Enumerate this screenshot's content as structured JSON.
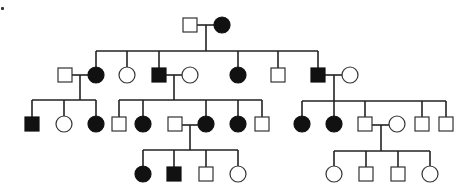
{
  "diagram": {
    "type": "pedigree",
    "corner_mark": ".",
    "colors": {
      "affected": "#111111",
      "unaffected": "#ffffff",
      "line": "#222222"
    },
    "legend": {
      "square": "male",
      "circle": "female",
      "filled": "affected",
      "open": "unaffected"
    },
    "generations": [
      {
        "label": "I",
        "y": 25,
        "individuals": [
          {
            "id": "I-1",
            "sex": "male",
            "affected": false,
            "x": 190
          },
          {
            "id": "I-2",
            "sex": "female",
            "affected": true,
            "x": 222
          }
        ]
      },
      {
        "label": "II",
        "y": 75,
        "individuals": [
          {
            "id": "II-spouse-1",
            "sex": "male",
            "affected": false,
            "x": 65,
            "married_in": true
          },
          {
            "id": "II-1",
            "sex": "female",
            "affected": true,
            "x": 96
          },
          {
            "id": "II-2",
            "sex": "female",
            "affected": false,
            "x": 127
          },
          {
            "id": "II-3",
            "sex": "male",
            "affected": true,
            "x": 159
          },
          {
            "id": "II-spouse-2",
            "sex": "female",
            "affected": false,
            "x": 190,
            "married_in": true
          },
          {
            "id": "II-4",
            "sex": "female",
            "affected": true,
            "x": 238
          },
          {
            "id": "II-5",
            "sex": "male",
            "affected": false,
            "x": 278
          },
          {
            "id": "II-6",
            "sex": "male",
            "affected": true,
            "x": 318
          },
          {
            "id": "II-spouse-3",
            "sex": "female",
            "affected": false,
            "x": 350,
            "married_in": true
          }
        ]
      },
      {
        "label": "III",
        "y": 124,
        "individuals": [
          {
            "id": "III-1",
            "sex": "male",
            "affected": true,
            "x": 32
          },
          {
            "id": "III-2",
            "sex": "female",
            "affected": false,
            "x": 64
          },
          {
            "id": "III-3",
            "sex": "female",
            "affected": true,
            "x": 96
          },
          {
            "id": "III-4",
            "sex": "male",
            "affected": false,
            "x": 119
          },
          {
            "id": "III-5",
            "sex": "female",
            "affected": true,
            "x": 143
          },
          {
            "id": "III-spouse-1",
            "sex": "male",
            "affected": false,
            "x": 175,
            "married_in": true
          },
          {
            "id": "III-6",
            "sex": "female",
            "affected": true,
            "x": 206
          },
          {
            "id": "III-7",
            "sex": "female",
            "affected": true,
            "x": 238
          },
          {
            "id": "III-8",
            "sex": "male",
            "affected": false,
            "x": 262
          },
          {
            "id": "III-9",
            "sex": "female",
            "affected": true,
            "x": 302
          },
          {
            "id": "III-10",
            "sex": "female",
            "affected": true,
            "x": 334
          },
          {
            "id": "III-11",
            "sex": "male",
            "affected": false,
            "x": 365
          },
          {
            "id": "III-spouse-2",
            "sex": "female",
            "affected": false,
            "x": 397,
            "married_in": true
          },
          {
            "id": "III-12",
            "sex": "male",
            "affected": false,
            "x": 422
          },
          {
            "id": "III-13",
            "sex": "male",
            "affected": false,
            "x": 446
          }
        ]
      },
      {
        "label": "IV",
        "y": 174,
        "individuals": [
          {
            "id": "IV-1",
            "sex": "female",
            "affected": true,
            "x": 143
          },
          {
            "id": "IV-2",
            "sex": "male",
            "affected": true,
            "x": 174
          },
          {
            "id": "IV-3",
            "sex": "male",
            "affected": false,
            "x": 206
          },
          {
            "id": "IV-4",
            "sex": "female",
            "affected": false,
            "x": 238
          },
          {
            "id": "IV-5",
            "sex": "female",
            "affected": false,
            "x": 334
          },
          {
            "id": "IV-6",
            "sex": "male",
            "affected": false,
            "x": 366
          },
          {
            "id": "IV-7",
            "sex": "male",
            "affected": false,
            "x": 398
          },
          {
            "id": "IV-8",
            "sex": "female",
            "affected": false,
            "x": 430
          }
        ]
      }
    ],
    "lines": [
      [
        197,
        25,
        214,
        25
      ],
      [
        206,
        25,
        206,
        51
      ],
      [
        96,
        51,
        318,
        51
      ],
      [
        96,
        51,
        96,
        67
      ],
      [
        127,
        51,
        127,
        67
      ],
      [
        159,
        51,
        159,
        68
      ],
      [
        238,
        51,
        238,
        67
      ],
      [
        278,
        51,
        278,
        68
      ],
      [
        318,
        51,
        318,
        68
      ],
      [
        72,
        75,
        88,
        75
      ],
      [
        80,
        75,
        80,
        100
      ],
      [
        32,
        100,
        96,
        100
      ],
      [
        32,
        100,
        32,
        117
      ],
      [
        64,
        100,
        64,
        116
      ],
      [
        96,
        100,
        96,
        116
      ],
      [
        166,
        75,
        182,
        75
      ],
      [
        174,
        75,
        174,
        100
      ],
      [
        119,
        100,
        262,
        100
      ],
      [
        119,
        100,
        119,
        117
      ],
      [
        143,
        100,
        143,
        116
      ],
      [
        206,
        100,
        206,
        116
      ],
      [
        238,
        100,
        238,
        116
      ],
      [
        262,
        100,
        262,
        117
      ],
      [
        325,
        75,
        342,
        75
      ],
      [
        334,
        75,
        334,
        101
      ],
      [
        302,
        101,
        446,
        101
      ],
      [
        302,
        101,
        302,
        116
      ],
      [
        334,
        101,
        334,
        116
      ],
      [
        365,
        101,
        365,
        117
      ],
      [
        422,
        101,
        422,
        117
      ],
      [
        446,
        101,
        446,
        117
      ],
      [
        182,
        125,
        198,
        125
      ],
      [
        190,
        125,
        190,
        150
      ],
      [
        143,
        150,
        238,
        150
      ],
      [
        143,
        150,
        143,
        166
      ],
      [
        174,
        150,
        174,
        167
      ],
      [
        206,
        150,
        206,
        167
      ],
      [
        238,
        150,
        238,
        166
      ],
      [
        372,
        125,
        389,
        125
      ],
      [
        381,
        125,
        381,
        151
      ],
      [
        334,
        151,
        430,
        151
      ],
      [
        334,
        151,
        334,
        166
      ],
      [
        366,
        151,
        366,
        167
      ],
      [
        398,
        151,
        398,
        167
      ],
      [
        430,
        151,
        430,
        166
      ]
    ],
    "symbol_size": 14
  }
}
